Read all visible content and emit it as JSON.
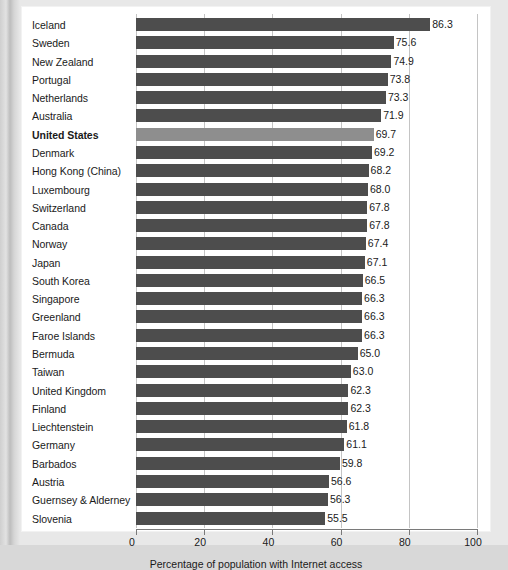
{
  "chart_data": {
    "type": "bar",
    "orientation": "horizontal",
    "title": "",
    "xlabel": "Percentage of population with Internet access",
    "ylabel": "",
    "xlim": [
      0,
      100
    ],
    "xticks": [
      0,
      20,
      40,
      60,
      80,
      100
    ],
    "grid": true,
    "legend": null,
    "highlight_category": "United States",
    "colors": {
      "bar": "#4d4d4d",
      "highlight_bar": "#8e8e8e",
      "gridline": "#c4c4c4",
      "axis": "#7a7a7a",
      "panel_background": "#ffffff",
      "page_background": "#d8d8d8",
      "text": "#1a1a1a"
    },
    "categories": [
      "Iceland",
      "Sweden",
      "New Zealand",
      "Portugal",
      "Netherlands",
      "Australia",
      "United States",
      "Denmark",
      "Hong Kong (China)",
      "Luxembourg",
      "Switzerland",
      "Canada",
      "Norway",
      "Japan",
      "South Korea",
      "Singapore",
      "Greenland",
      "Faroe Islands",
      "Bermuda",
      "Taiwan",
      "United Kingdom",
      "Finland",
      "Liechtenstein",
      "Germany",
      "Barbados",
      "Austria",
      "Guernsey & Alderney",
      "Slovenia"
    ],
    "values": [
      86.3,
      75.6,
      74.9,
      73.8,
      73.3,
      71.9,
      69.7,
      69.2,
      68.2,
      68.0,
      67.8,
      67.8,
      67.4,
      67.1,
      66.5,
      66.3,
      66.3,
      66.3,
      65.0,
      63.0,
      62.3,
      62.3,
      61.8,
      61.1,
      59.8,
      56.6,
      56.3,
      55.5
    ],
    "value_labels": [
      "86.3",
      "75.6",
      "74.9",
      "73.8",
      "73.3",
      "71.9",
      "69.7",
      "69.2",
      "68.2",
      "68.0",
      "67.8",
      "67.8",
      "67.4",
      "67.1",
      "66.5",
      "66.3",
      "66.3",
      "66.3",
      "65.0",
      "63.0",
      "62.3",
      "62.3",
      "61.8",
      "61.1",
      "59.8",
      "56.6",
      "56.3",
      "55.5"
    ],
    "tick_labels": [
      "0",
      "20",
      "40",
      "60",
      "80",
      "100"
    ]
  }
}
